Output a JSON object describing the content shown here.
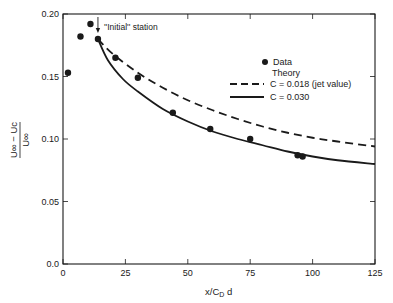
{
  "chart_data": {
    "type": "scatter",
    "title": "",
    "xlabel": "x/C_D d",
    "ylabel": "(U∞ − Uc) / U∞",
    "xlim": [
      0,
      125
    ],
    "ylim": [
      0.0,
      0.2
    ],
    "x_ticks": [
      0,
      25,
      50,
      75,
      100,
      125
    ],
    "y_ticks": [
      0.0,
      0.05,
      0.1,
      0.15,
      0.2
    ],
    "x_tick_labels": [
      "0",
      "25",
      "50",
      "75",
      "100",
      "125"
    ],
    "y_tick_labels": [
      "0.0",
      "0.05",
      "0.10",
      "0.15",
      "0.20"
    ],
    "grid": false,
    "legend_position": "upper right",
    "legend": {
      "data_label": "Data",
      "theory_heading": "Theory",
      "entries": [
        "C = 0.018 (jet value)",
        "C = 0.030"
      ]
    },
    "annotation": {
      "text": "''Initial'' station",
      "x": 14,
      "y": 0.192
    },
    "series": [
      {
        "name": "Data",
        "style": "markers",
        "x": [
          2,
          7,
          11,
          14,
          21,
          30,
          44,
          59,
          75,
          94,
          96
        ],
        "y": [
          0.153,
          0.182,
          0.192,
          0.18,
          0.165,
          0.149,
          0.121,
          0.108,
          0.1,
          0.087,
          0.086
        ]
      },
      {
        "name": "C = 0.018 (jet value)",
        "style": "dashed",
        "x": [
          14,
          20,
          30,
          40,
          50,
          60,
          70,
          80,
          90,
          100,
          110,
          125
        ],
        "y": [
          0.18,
          0.168,
          0.153,
          0.141,
          0.131,
          0.123,
          0.116,
          0.11,
          0.105,
          0.101,
          0.098,
          0.094
        ]
      },
      {
        "name": "C = 0.030",
        "style": "solid",
        "x": [
          14,
          18,
          24,
          30,
          40,
          50,
          60,
          70,
          80,
          90,
          100,
          110,
          125
        ],
        "y": [
          0.18,
          0.163,
          0.148,
          0.138,
          0.124,
          0.114,
          0.106,
          0.1,
          0.095,
          0.09,
          0.086,
          0.083,
          0.08
        ]
      }
    ]
  },
  "labels": {
    "y_num": "U∞ − Uc",
    "y_den": "U∞",
    "x_main": "x/C",
    "x_sub": "D",
    "x_tail": " d"
  }
}
